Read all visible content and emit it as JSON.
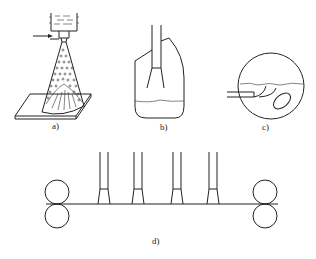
{
  "figure": {
    "panels": [
      {
        "id": "a",
        "label": "a)",
        "description": "spray deposition: crucible with melt, gas inlet arrow, atomized cone of droplets onto substrate plate"
      },
      {
        "id": "b",
        "label": "b)",
        "description": "tundish/vessel with nozzle tube dipping toward liquid surface"
      },
      {
        "id": "c",
        "label": "c)",
        "description": "circular rotating drum with liquid layer and inlet tube"
      },
      {
        "id": "d",
        "label": "d)",
        "description": "strip between two roller pairs with four spray nozzles above"
      }
    ]
  },
  "colors": {
    "line": "#222222",
    "background": "#ffffff"
  }
}
